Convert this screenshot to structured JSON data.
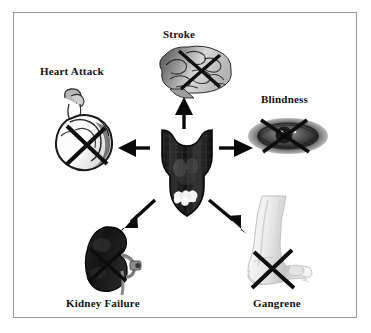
{
  "figure": {
    "title_present": false,
    "background_color": "#ffffff",
    "border_color": "#9a9a9a",
    "width": 371,
    "height": 333
  },
  "center": {
    "icon": "pancreas-organ-icon",
    "label": "",
    "colors": {
      "body": "#1c1c1c",
      "shade": "#3a3a3a",
      "highlight": "#f2f2f2"
    }
  },
  "nodes": [
    {
      "id": "stroke",
      "label": "Stroke",
      "icon": "brain-icon",
      "crossed_out": true,
      "direction": "up",
      "label_x": 163,
      "label_y": 28
    },
    {
      "id": "heart-attack",
      "label": "Heart Attack",
      "icon": "heart-icon",
      "crossed_out": true,
      "direction": "left",
      "label_x": 40,
      "label_y": 65
    },
    {
      "id": "blindness",
      "label": "Blindness",
      "icon": "eye-icon",
      "crossed_out": true,
      "direction": "right",
      "label_x": 261,
      "label_y": 93
    },
    {
      "id": "kidney-failure",
      "label": "Kidney Failure",
      "icon": "kidney-icon",
      "crossed_out": true,
      "direction": "down-left",
      "label_x": 66,
      "label_y": 297
    },
    {
      "id": "gangrene",
      "label": "Gangrene",
      "icon": "foot-leg-icon",
      "crossed_out": true,
      "direction": "down-right",
      "label_x": 253,
      "label_y": 297
    }
  ],
  "arrows": [
    {
      "id": "arrow-to-stroke",
      "from": "center",
      "to": "stroke",
      "style": "solid-filled-head"
    },
    {
      "id": "arrow-to-heart-attack",
      "from": "center",
      "to": "heart-attack",
      "style": "solid-filled-head"
    },
    {
      "id": "arrow-to-blindness",
      "from": "center",
      "to": "blindness",
      "style": "solid-filled-head"
    },
    {
      "id": "arrow-to-kidney-failure",
      "from": "center",
      "to": "kidney-failure",
      "style": "solid-filled-head"
    },
    {
      "id": "arrow-to-gangrene",
      "from": "center",
      "to": "gangrene",
      "style": "solid-filled-head"
    }
  ],
  "cross_mark": {
    "color": "#0d0d0d",
    "meaning": "damage-or-failure"
  }
}
